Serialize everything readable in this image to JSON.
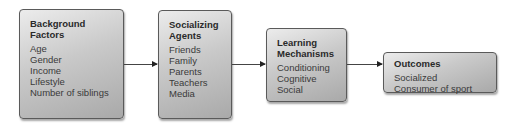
{
  "diagram": {
    "type": "flowchart",
    "boxes": [
      {
        "id": "background-factors",
        "title_lines": [
          "Background",
          "Factors"
        ],
        "items": [
          "Age",
          "Gender",
          "Income",
          "Lifestyle",
          "Number of siblings"
        ]
      },
      {
        "id": "socializing-agents",
        "title_lines": [
          "Socializing",
          "Agents"
        ],
        "items": [
          "Friends",
          "Family",
          "Parents",
          "Teachers",
          "Media"
        ]
      },
      {
        "id": "learning-mechanisms",
        "title_lines": [
          "Learning",
          "Mechanisms"
        ],
        "items": [
          "Conditioning",
          "Cognitive",
          "Social"
        ]
      },
      {
        "id": "outcomes",
        "title_lines": [
          "Outcomes"
        ],
        "items": [
          "Socialized",
          "Consumer of sport"
        ]
      }
    ],
    "edges": [
      {
        "from": "background-factors",
        "to": "socializing-agents"
      },
      {
        "from": "socializing-agents",
        "to": "learning-mechanisms"
      },
      {
        "from": "learning-mechanisms",
        "to": "outcomes"
      }
    ]
  }
}
